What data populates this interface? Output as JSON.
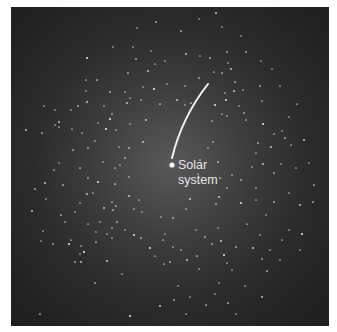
{
  "diagram": {
    "type": "star-field",
    "background_color": "#2a2a2a",
    "glow_color": "#585858",
    "star_color": "#e8e8e8",
    "arc_color": "#f2f2f2",
    "marker": {
      "label_line1": "Solar",
      "label_line2": "system",
      "x": 172,
      "y": 165
    },
    "arc": {
      "from": [
        208,
        84
      ],
      "to": [
        172,
        158
      ]
    }
  },
  "stars": [
    [
      87,
      58
    ],
    [
      113,
      47
    ],
    [
      133,
      47
    ],
    [
      97,
      80
    ],
    [
      86,
      91
    ],
    [
      87,
      102
    ],
    [
      78,
      106
    ],
    [
      55,
      110
    ],
    [
      71,
      110
    ],
    [
      110,
      92
    ],
    [
      127,
      103
    ],
    [
      104,
      106
    ],
    [
      112,
      114
    ],
    [
      44,
      106
    ],
    [
      59,
      127
    ],
    [
      110,
      119
    ],
    [
      86,
      80
    ],
    [
      137,
      28
    ],
    [
      181,
      31
    ],
    [
      151,
      51
    ],
    [
      186,
      54
    ],
    [
      136,
      59
    ],
    [
      165,
      61
    ],
    [
      200,
      56
    ],
    [
      210,
      58
    ],
    [
      148,
      71
    ],
    [
      155,
      64
    ],
    [
      128,
      73
    ],
    [
      143,
      87
    ],
    [
      125,
      92
    ],
    [
      154,
      89
    ],
    [
      167,
      84
    ],
    [
      185,
      86
    ],
    [
      199,
      78
    ],
    [
      214,
      72
    ],
    [
      177,
      100
    ],
    [
      191,
      103
    ],
    [
      141,
      100
    ],
    [
      130,
      98
    ],
    [
      160,
      104
    ],
    [
      146,
      120
    ],
    [
      185,
      105
    ],
    [
      222,
      73
    ],
    [
      225,
      93
    ],
    [
      222,
      114
    ],
    [
      215,
      105
    ],
    [
      222,
      27
    ],
    [
      241,
      36
    ],
    [
      227,
      52
    ],
    [
      228,
      63
    ],
    [
      231,
      69
    ],
    [
      246,
      52
    ],
    [
      261,
      61
    ],
    [
      272,
      69
    ],
    [
      235,
      82
    ],
    [
      234,
      91
    ],
    [
      243,
      90
    ],
    [
      260,
      86
    ],
    [
      280,
      86
    ],
    [
      262,
      101
    ],
    [
      226,
      100
    ],
    [
      227,
      116
    ],
    [
      239,
      106
    ],
    [
      244,
      113
    ],
    [
      297,
      104
    ],
    [
      26,
      130
    ],
    [
      42,
      133
    ],
    [
      55,
      125
    ],
    [
      72,
      129
    ],
    [
      73,
      150
    ],
    [
      59,
      122
    ],
    [
      82,
      133
    ],
    [
      88,
      148
    ],
    [
      95,
      141
    ],
    [
      98,
      123
    ],
    [
      106,
      129
    ],
    [
      116,
      130
    ],
    [
      119,
      147
    ],
    [
      80,
      168
    ],
    [
      54,
      170
    ],
    [
      45,
      183
    ],
    [
      35,
      189
    ],
    [
      46,
      199
    ],
    [
      59,
      163
    ],
    [
      63,
      185
    ],
    [
      87,
      194
    ],
    [
      103,
      162
    ],
    [
      88,
      178
    ],
    [
      93,
      193
    ],
    [
      80,
      203
    ],
    [
      98,
      182
    ],
    [
      112,
      202
    ],
    [
      115,
      168
    ],
    [
      125,
      158
    ],
    [
      88,
      224
    ],
    [
      104,
      208
    ],
    [
      113,
      210
    ],
    [
      96,
      232
    ],
    [
      75,
      212
    ],
    [
      61,
      215
    ],
    [
      32,
      211
    ],
    [
      100,
      222
    ],
    [
      117,
      222
    ],
    [
      107,
      234
    ],
    [
      112,
      238
    ],
    [
      84,
      252
    ],
    [
      65,
      222
    ],
    [
      41,
      241
    ],
    [
      53,
      244
    ],
    [
      130,
      124
    ],
    [
      143,
      142
    ],
    [
      129,
      148
    ],
    [
      120,
      165
    ],
    [
      129,
      177
    ],
    [
      115,
      184
    ],
    [
      129,
      196
    ],
    [
      134,
      209
    ],
    [
      116,
      206
    ],
    [
      142,
      212
    ],
    [
      139,
      200
    ],
    [
      134,
      235
    ],
    [
      161,
      217
    ],
    [
      163,
      240
    ],
    [
      173,
      218
    ],
    [
      186,
      209
    ],
    [
      190,
      199
    ],
    [
      200,
      160
    ],
    [
      212,
      121
    ],
    [
      213,
      142
    ],
    [
      218,
      162
    ],
    [
      219,
      197
    ],
    [
      208,
      148
    ],
    [
      216,
      204
    ],
    [
      198,
      174
    ],
    [
      246,
      120
    ],
    [
      263,
      124
    ],
    [
      274,
      134
    ],
    [
      291,
      145
    ],
    [
      258,
      143
    ],
    [
      256,
      153
    ],
    [
      271,
      147
    ],
    [
      285,
      138
    ],
    [
      289,
      117
    ],
    [
      282,
      131
    ],
    [
      274,
      173
    ],
    [
      263,
      164
    ],
    [
      252,
      167
    ],
    [
      241,
      180
    ],
    [
      256,
      188
    ],
    [
      232,
      175
    ],
    [
      241,
      203
    ],
    [
      256,
      200
    ],
    [
      266,
      215
    ],
    [
      274,
      202
    ],
    [
      289,
      193
    ],
    [
      300,
      205
    ],
    [
      313,
      202
    ],
    [
      281,
      164
    ],
    [
      309,
      163
    ],
    [
      314,
      185
    ],
    [
      304,
      140
    ],
    [
      296,
      168
    ],
    [
      220,
      178
    ],
    [
      227,
      188
    ],
    [
      43,
      231
    ],
    [
      69,
      244
    ],
    [
      81,
      246
    ],
    [
      80,
      254
    ],
    [
      96,
      242
    ],
    [
      71,
      240
    ],
    [
      107,
      261
    ],
    [
      95,
      283
    ],
    [
      122,
      274
    ],
    [
      112,
      228
    ],
    [
      75,
      262
    ],
    [
      81,
      262
    ],
    [
      125,
      230
    ],
    [
      141,
      238
    ],
    [
      165,
      234
    ],
    [
      173,
      247
    ],
    [
      150,
      248
    ],
    [
      155,
      256
    ],
    [
      164,
      264
    ],
    [
      170,
      262
    ],
    [
      181,
      250
    ],
    [
      187,
      260
    ],
    [
      197,
      256
    ],
    [
      199,
      269
    ],
    [
      178,
      286
    ],
    [
      174,
      300
    ],
    [
      160,
      306
    ],
    [
      190,
      297
    ],
    [
      206,
      305
    ],
    [
      215,
      294
    ],
    [
      219,
      283
    ],
    [
      224,
      255
    ],
    [
      232,
      270
    ],
    [
      218,
      228
    ],
    [
      205,
      237
    ],
    [
      196,
      230
    ],
    [
      221,
      241
    ],
    [
      212,
      244
    ],
    [
      247,
      224
    ],
    [
      260,
      235
    ],
    [
      236,
      247
    ],
    [
      253,
      248
    ],
    [
      270,
      250
    ],
    [
      262,
      259
    ],
    [
      282,
      240
    ],
    [
      289,
      230
    ],
    [
      302,
      234
    ],
    [
      280,
      260
    ],
    [
      227,
      263
    ],
    [
      267,
      271
    ],
    [
      245,
      286
    ],
    [
      262,
      297
    ],
    [
      228,
      303
    ],
    [
      300,
      250
    ],
    [
      128,
      3
    ],
    [
      156,
      22
    ],
    [
      216,
      13
    ],
    [
      199,
      19
    ],
    [
      40,
      314
    ],
    [
      186,
      314
    ],
    [
      236,
      314
    ],
    [
      130,
      316
    ]
  ]
}
